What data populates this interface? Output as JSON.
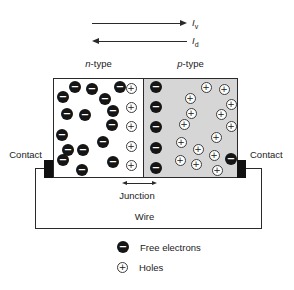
{
  "figure": {
    "currents": {
      "top": {
        "symbol": "I",
        "subscript": "v"
      },
      "bottom": {
        "symbol": "I",
        "subscript": "d"
      }
    },
    "regions": {
      "n": {
        "label_italic": "n",
        "label_rest": "-type"
      },
      "p": {
        "label_italic": "p",
        "label_rest": "-type"
      }
    },
    "contact_left_label": "Contact",
    "contact_right_label": "Contact",
    "junction_label": "Junction",
    "wire_label": "Wire"
  },
  "particles": {
    "electron_symbol": "−",
    "hole_symbol": "+",
    "n_electrons": [
      [
        75,
        87
      ],
      [
        92,
        89
      ],
      [
        120,
        87
      ],
      [
        63,
        97
      ],
      [
        105,
        99
      ],
      [
        67,
        114
      ],
      [
        85,
        115
      ],
      [
        113,
        111
      ],
      [
        112,
        125
      ],
      [
        62,
        135
      ],
      [
        103,
        142
      ],
      [
        68,
        150
      ],
      [
        83,
        150
      ],
      [
        63,
        160
      ],
      [
        113,
        162
      ],
      [
        82,
        170
      ]
    ],
    "n_holes": [
      [
        131,
        88
      ],
      [
        131,
        107
      ],
      [
        131,
        126
      ],
      [
        131,
        146
      ],
      [
        131,
        165
      ]
    ],
    "p_electrons": [
      [
        156,
        87
      ],
      [
        156,
        107
      ],
      [
        156,
        127
      ],
      [
        156,
        148
      ],
      [
        156,
        168
      ],
      [
        231,
        159
      ]
    ],
    "p_holes": [
      [
        206,
        87
      ],
      [
        224,
        89
      ],
      [
        190,
        98
      ],
      [
        231,
        104
      ],
      [
        191,
        113
      ],
      [
        221,
        114
      ],
      [
        184,
        124
      ],
      [
        231,
        126
      ],
      [
        216,
        137
      ],
      [
        181,
        142
      ],
      [
        198,
        149
      ],
      [
        214,
        155
      ],
      [
        180,
        160
      ],
      [
        196,
        164
      ],
      [
        217,
        170
      ]
    ]
  },
  "legend": {
    "items": [
      {
        "label": "Free electrons"
      },
      {
        "label": "Holes"
      }
    ]
  },
  "colors": {
    "p_region_bg": "#d6d6d6",
    "ink": "#222222"
  }
}
